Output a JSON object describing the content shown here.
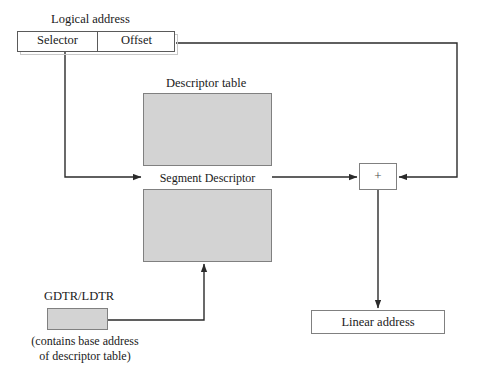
{
  "diagram": {
    "colors": {
      "line": "#2b2b2b",
      "box_border": "#808080",
      "fill_gray": "#d3d3d3",
      "fill_white": "#ffffff",
      "background": "#ffffff",
      "text": "#1a1a1a"
    },
    "logical_address": {
      "title": "Logical address",
      "selector_label": "Selector",
      "offset_label": "Offset"
    },
    "descriptor_table": {
      "title": "Descriptor table",
      "entry_label": "Segment Descriptor"
    },
    "adder": {
      "symbol": "+"
    },
    "linear_address": {
      "label": "Linear address"
    },
    "gdtr": {
      "title": "GDTR/LDTR",
      "caption_line1": "(contains base address",
      "caption_line2": "of descriptor table)"
    },
    "connectors": [
      {
        "name": "selector-to-descriptor",
        "from": "Selector",
        "to": "Segment Descriptor"
      },
      {
        "name": "offset-to-adder",
        "from": "Offset",
        "to": "+"
      },
      {
        "name": "descriptor-to-adder",
        "from": "Segment Descriptor",
        "to": "+"
      },
      {
        "name": "gdtr-to-descriptor-table",
        "from": "GDTR/LDTR",
        "to": "Descriptor table"
      },
      {
        "name": "adder-to-linear-address",
        "from": "+",
        "to": "Linear address"
      }
    ]
  }
}
